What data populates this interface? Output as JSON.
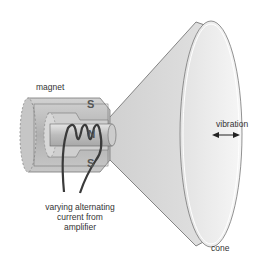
{
  "diagram": {
    "labels": {
      "magnet": "magnet",
      "vibration": "vibration",
      "cone": "cone",
      "current_line1": "varying alternating",
      "current_line2": "current from",
      "current_line3": "amplifier",
      "pole_top": "S",
      "pole_center": "N",
      "pole_bottom": "S"
    },
    "colors": {
      "background": "#ffffff",
      "cone_fill": "#d9d9d9",
      "cone_inner": "#ececec",
      "magnet_fill": "#bdbdbd",
      "wire": "#3a3a3a",
      "text": "#333333"
    },
    "icons": {
      "vibration_arrow": "double-headed-arrow"
    }
  }
}
